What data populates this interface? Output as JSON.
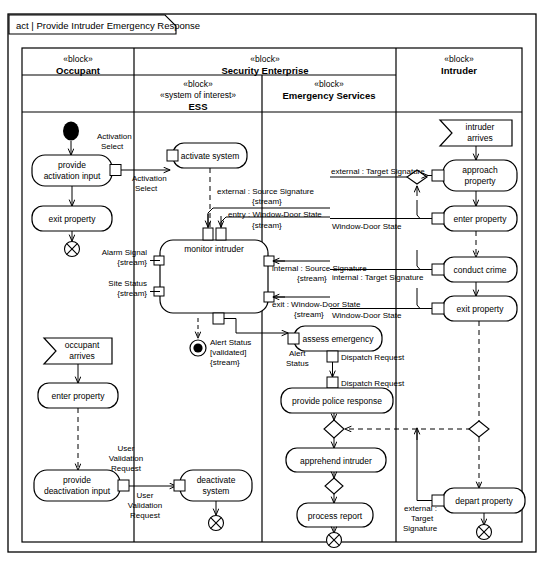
{
  "diagram": {
    "kind": "act",
    "separator": "|",
    "title": "Provide Intruder Emergency Response",
    "frame_label": "act  |  Provide Intruder Emergency Response"
  },
  "partitions": [
    {
      "id": "occupant",
      "stereotype": "«block»",
      "name": "Occupant"
    },
    {
      "id": "security",
      "stereotype": "«block»",
      "name": "Security Enterprise"
    },
    {
      "id": "ess",
      "stereotype": "«block»",
      "stereotype2": "«system of interest»",
      "name": "ESS"
    },
    {
      "id": "emergency",
      "stereotype": "«block»",
      "name": "Emergency Services"
    },
    {
      "id": "intruder",
      "stereotype": "«block»",
      "name": "Intruder"
    }
  ],
  "actions": {
    "provide_activation_input": {
      "line1": "provide",
      "line2": "activation input"
    },
    "exit_property_occ": {
      "line1": "exit property"
    },
    "occupant_arrives": {
      "line1": "occupant",
      "line2": "arrives"
    },
    "enter_property_occ": {
      "line1": "enter property"
    },
    "provide_deactivation_input": {
      "line1": "provide",
      "line2": "deactivation input"
    },
    "activate_system": {
      "line1": "activate system"
    },
    "monitor_intruder": {
      "line1": "monitor intruder"
    },
    "deactivate_system": {
      "line1": "deactivate",
      "line2": "system"
    },
    "assess_emergency": {
      "line1": "assess emergency"
    },
    "provide_police_response": {
      "line1": "provide police response"
    },
    "apprehend_intruder": {
      "line1": "apprehend intruder"
    },
    "process_report": {
      "line1": "process report"
    },
    "intruder_arrives": {
      "line1": "intruder",
      "line2": "arrives"
    },
    "approach_property": {
      "line1": "approach",
      "line2": "property"
    },
    "enter_property_int": {
      "line1": "enter property"
    },
    "conduct_crime": {
      "line1": "conduct crime"
    },
    "exit_property_int": {
      "line1": "exit property"
    },
    "depart_property": {
      "line1": "depart property"
    }
  },
  "pins": {
    "activation_select_out": {
      "line1": "Activation",
      "line2": "Select"
    },
    "activation_select_in": {
      "line1": "Activation",
      "line2": "Select"
    },
    "external_source_signature": {
      "line1": "external : Source Signature",
      "line2": "{stream}"
    },
    "entry_window_door_state": {
      "line1": "entry : Window-Door State",
      "line2": "{stream}"
    },
    "internal_source_signature": {
      "line1": "internal : Source Signature",
      "line2": "{stream}"
    },
    "exit_window_door_state": {
      "line1": "exit : Window-Door State",
      "line2": "{stream}"
    },
    "alarm_signal": {
      "line1": "Alarm Signal",
      "line2": "{stream}"
    },
    "site_status": {
      "line1": "Site Status",
      "line2": "{stream}"
    },
    "alert_status_validated": {
      "line1": "Alert Status",
      "line2": "[validated]",
      "line3": "{stream}"
    },
    "alert_status_in": {
      "line1": "Alert",
      "line2": "Status"
    },
    "dispatch_request_out": {
      "line1": "Dispatch Request"
    },
    "dispatch_request_in": {
      "line1": "Dispatch Request"
    },
    "user_validation_request_out": {
      "line1": "User",
      "line2": "Validation",
      "line3": "Request"
    },
    "user_validation_request_in": {
      "line1": "User",
      "line2": "Validation",
      "line3": "Request"
    },
    "external_target_signature_top": {
      "line1": "external : Target Signature"
    },
    "window_door_state_enter": {
      "line1": "Window-Door State"
    },
    "internal_target_signature": {
      "line1": "internal : Target Signature"
    },
    "window_door_state_exit": {
      "line1": "Window-Door State"
    },
    "external_target_signature_bottom": {
      "line1": "external :",
      "line2": "Target",
      "line3": "Signature"
    }
  },
  "colors": {
    "stroke": "#000000",
    "fill": "#ffffff",
    "background": "#ffffff",
    "node_fill": "#ffffff"
  }
}
